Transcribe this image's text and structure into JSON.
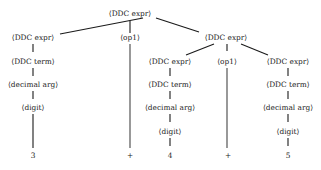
{
  "diagram": {
    "type": "parse-tree",
    "nodes": {
      "root": {
        "label": "⟨DDC expr⟩",
        "x": 160,
        "y": 14
      },
      "l1_left": {
        "label": "⟨DDC expr⟩",
        "x": 33,
        "y": 38
      },
      "l1_op": {
        "label": "⟨op1⟩",
        "x": 130,
        "y": 38
      },
      "l1_right": {
        "label": "⟨DDC expr⟩",
        "x": 226,
        "y": 38
      },
      "l_term": {
        "label": "⟨DDC term⟩",
        "x": 33,
        "y": 62
      },
      "l_dec": {
        "label": "⟨decimal arg⟩",
        "x": 33,
        "y": 85
      },
      "l_digit": {
        "label": "⟨digit⟩",
        "x": 33,
        "y": 108
      },
      "l_leaf": {
        "label": "3",
        "x": 33,
        "y": 160
      },
      "op1_leaf": {
        "label": "+",
        "x": 130,
        "y": 160
      },
      "r_left": {
        "label": "⟨DDC expr⟩",
        "x": 170,
        "y": 62
      },
      "r_op": {
        "label": "⟨op1⟩",
        "x": 227,
        "y": 62
      },
      "r_right": {
        "label": "⟨DDC expr⟩",
        "x": 288,
        "y": 62
      },
      "rl_term": {
        "label": "⟨DDC term⟩",
        "x": 170,
        "y": 85
      },
      "rl_dec": {
        "label": "⟨decimal arg⟩",
        "x": 170,
        "y": 108
      },
      "rl_digit": {
        "label": "⟨digit⟩",
        "x": 170,
        "y": 132
      },
      "rl_leaf": {
        "label": "4",
        "x": 170,
        "y": 160
      },
      "rop_leaf": {
        "label": "+",
        "x": 228,
        "y": 160
      },
      "rr_term": {
        "label": "⟨DDC term⟩",
        "x": 288,
        "y": 85
      },
      "rr_dec": {
        "label": "⟨decimal arg⟩",
        "x": 288,
        "y": 108
      },
      "rr_digit": {
        "label": "⟨digit⟩",
        "x": 288,
        "y": 132
      },
      "rr_leaf": {
        "label": "5",
        "x": 288,
        "y": 160
      }
    },
    "edges": [
      [
        "root",
        "l1_left"
      ],
      [
        "root",
        "l1_op"
      ],
      [
        "root",
        "l1_right"
      ],
      [
        "l1_left",
        "l_term"
      ],
      [
        "l_term",
        "l_dec"
      ],
      [
        "l_dec",
        "l_digit"
      ],
      [
        "l_digit",
        "l_leaf"
      ],
      [
        "l1_op",
        "op1_leaf"
      ],
      [
        "l1_right",
        "r_left"
      ],
      [
        "l1_right",
        "r_op"
      ],
      [
        "l1_right",
        "r_right"
      ],
      [
        "r_left",
        "rl_term"
      ],
      [
        "rl_term",
        "rl_dec"
      ],
      [
        "rl_dec",
        "rl_digit"
      ],
      [
        "rl_digit",
        "rl_leaf"
      ],
      [
        "r_op",
        "rop_leaf"
      ],
      [
        "r_right",
        "rr_term"
      ],
      [
        "rr_term",
        "rr_dec"
      ],
      [
        "rr_dec",
        "rr_digit"
      ],
      [
        "rr_digit",
        "rr_leaf"
      ]
    ],
    "colors": {
      "line": "#1a1a1a",
      "text": "#222222",
      "background": "#ffffff"
    }
  }
}
